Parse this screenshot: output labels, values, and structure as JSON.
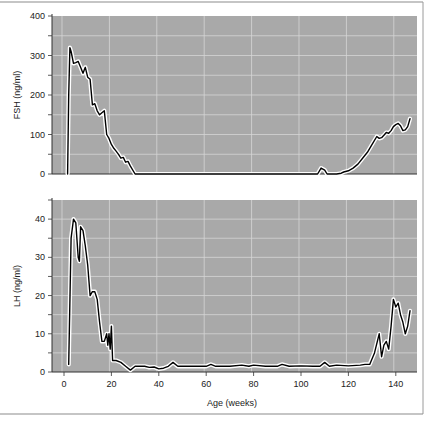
{
  "chart_data": [
    {
      "type": "line",
      "title": "",
      "xlabel": "",
      "ylabel": "FSH (ng/ml)",
      "xlim": [
        -4,
        149
      ],
      "ylim": [
        0,
        400
      ],
      "yticks": [
        0,
        100,
        200,
        300,
        400
      ],
      "grid": true,
      "series": [
        {
          "name": "FSH",
          "x": [
            1.5,
            2,
            2.5,
            3,
            4,
            5,
            6,
            7,
            8,
            9,
            10,
            11,
            12,
            13,
            14,
            15,
            16,
            17,
            18,
            19,
            20,
            21,
            22,
            23,
            24,
            25,
            26,
            27,
            28,
            30,
            40,
            60,
            80,
            100,
            107,
            108.5,
            110,
            111,
            115,
            117,
            118,
            120,
            122,
            124,
            126,
            128,
            130,
            132,
            133,
            134,
            135,
            136,
            137,
            138,
            139,
            140,
            141,
            142,
            143,
            144,
            145,
            146
          ],
          "y": [
            0,
            200,
            320,
            310,
            280,
            282,
            285,
            270,
            255,
            270,
            245,
            240,
            175,
            178,
            160,
            150,
            155,
            160,
            100,
            90,
            75,
            65,
            58,
            50,
            40,
            42,
            30,
            32,
            20,
            0,
            0,
            0,
            0,
            0,
            0,
            15,
            10,
            0,
            0,
            2,
            5,
            8,
            15,
            25,
            40,
            55,
            75,
            95,
            90,
            92,
            98,
            105,
            103,
            110,
            120,
            125,
            128,
            122,
            110,
            112,
            120,
            140
          ]
        }
      ]
    },
    {
      "type": "line",
      "title": "",
      "xlabel": "Age (weeks)",
      "ylabel": "LH (ng/ml)",
      "xlim": [
        -4,
        149
      ],
      "ylim": [
        0,
        45
      ],
      "xticks": [
        0,
        20,
        40,
        60,
        80,
        100,
        120,
        140
      ],
      "yticks": [
        0,
        10,
        20,
        30,
        40
      ],
      "grid": true,
      "series": [
        {
          "name": "LH",
          "x": [
            2,
            3,
            4,
            5,
            6,
            6.5,
            7,
            8,
            9,
            10,
            11,
            12,
            13,
            14,
            15,
            16,
            17,
            18,
            18.5,
            19,
            19.5,
            20,
            20.5,
            22,
            24,
            26,
            28,
            30,
            32,
            34,
            36,
            38,
            40,
            42,
            44,
            46,
            48,
            50,
            55,
            60,
            62,
            64,
            70,
            75,
            78,
            80,
            85,
            90,
            92,
            95,
            100,
            105,
            108,
            110,
            112,
            115,
            120,
            125,
            127,
            129,
            131,
            133,
            134,
            135,
            136,
            137,
            138,
            139,
            140,
            141,
            142,
            143,
            144,
            145,
            146
          ],
          "y": [
            2,
            35,
            40,
            39,
            30,
            29,
            38,
            37,
            33,
            28,
            20,
            21,
            21,
            19,
            13,
            8,
            8,
            10,
            7,
            10,
            6,
            12,
            3,
            3,
            2.5,
            1.5,
            0.5,
            1.5,
            1.5,
            1.5,
            1.2,
            1.3,
            0.8,
            1,
            1.5,
            2.5,
            1.5,
            1.5,
            1.5,
            1.5,
            2,
            1.5,
            1.5,
            1.8,
            1.5,
            1.8,
            1.5,
            1.5,
            2,
            1.5,
            1.6,
            1.5,
            1.5,
            2.5,
            1.5,
            1.8,
            1.6,
            1.8,
            2,
            2,
            5,
            10,
            4,
            7,
            8,
            6,
            12,
            19,
            17,
            18,
            15,
            13,
            10,
            12,
            16
          ]
        }
      ]
    }
  ],
  "figure": {
    "panel_bg": "#a9a9a9",
    "grid_color": "#d6d6d6",
    "line_color": "#000000",
    "halo_color": "#ffffff",
    "frame_color": "#9a9a9a"
  }
}
